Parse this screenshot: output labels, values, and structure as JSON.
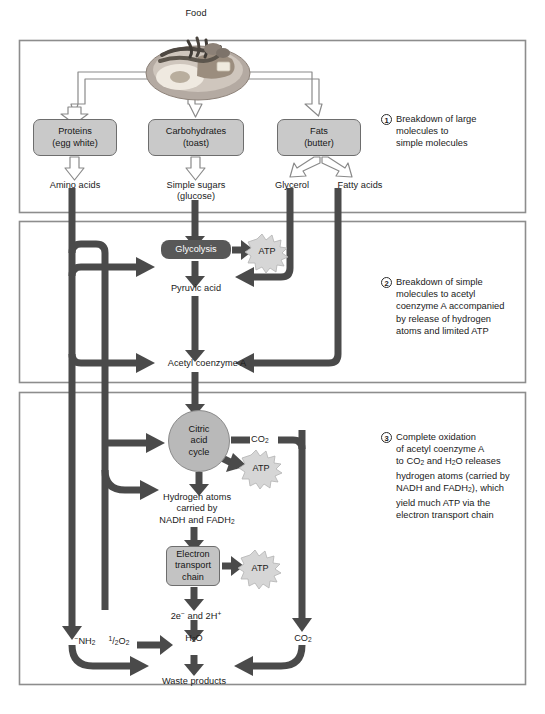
{
  "figure": {
    "top_label": "Food"
  },
  "stages": [
    {
      "number": "1",
      "caption": "Breakdown of large\nmolecules to\nsimple molecules"
    },
    {
      "number": "2",
      "caption": "Breakdown of simple\nmolecules to acetyl\ncoenzyme A accompanied\nby release of hydrogen\natoms and limited ATP"
    },
    {
      "number": "3",
      "caption": "Complete oxidation\nof acetyl coenzyme A\nto CO2 and H2O releases\nhydrogen atoms (carried by\nNADH and FADH2), which\nyield much ATP via the\nelectron transport chain"
    }
  ],
  "nodes": {
    "proteins": "Proteins\n(egg white)",
    "carbohydrates": "Carbohydrates\n(toast)",
    "fats": "Fats\n(butter)",
    "amino_acids": "Amino acids",
    "simple_sugars": "Simple sugars\n(glucose)",
    "glycerol": "Glycerol",
    "fatty_acids": "Fatty acids",
    "glycolysis": "Glycolysis",
    "pyruvic_acid": "Pyruvic acid",
    "acetyl_coa": "Acetyl coenzyme A",
    "citric_acid_cycle": "Citric\nacid\ncycle",
    "hydrogen_atoms": "Hydrogen atoms\ncarried by\nNADH and FADH2",
    "electron_transport_chain": "Electron\ntransport\nchain",
    "waste_products": "Waste products",
    "atp": "ATP"
  },
  "molecules": {
    "co2": "CO2",
    "co2_lower": "CO2",
    "h2o": "H2O",
    "nh2": "-NH2",
    "half_o2": "1/2 O2",
    "electrons_protons": "2e- and 2H+"
  },
  "colors": {
    "arrow_fill": "#4a4a4a",
    "box_fill": "#c9c9c9",
    "box_stroke": "#6d6d6d",
    "dark_pill": "#585858",
    "frame_stroke": "#8d8d8d",
    "atp_fill": "#d6d6d6",
    "cycle_fill": "#b9b9b9",
    "text": "#1a1a1a"
  }
}
